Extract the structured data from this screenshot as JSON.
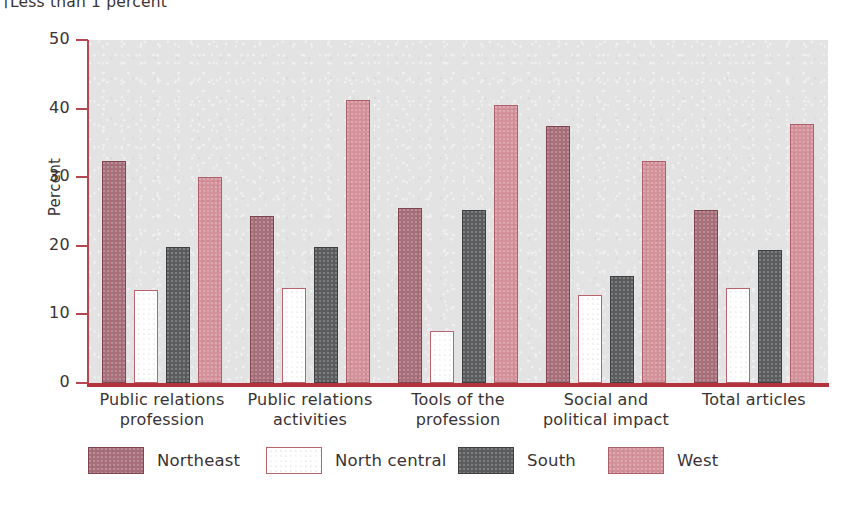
{
  "footnote": "†Less than 1 percent",
  "legend": {
    "position": "bottom",
    "items": [
      {
        "label": "Northeast",
        "key": "northeast",
        "color": "#a8707a"
      },
      {
        "label": "North central",
        "key": "northcentral",
        "color": "#ffffff"
      },
      {
        "label": "South",
        "key": "south",
        "color": "#5b5d5f"
      },
      {
        "label": "West",
        "key": "west",
        "color": "#d4929a"
      }
    ]
  },
  "axis": {
    "y_title": "Percent",
    "y_ticks": [
      "0",
      "10",
      "20",
      "30",
      "40",
      "50"
    ]
  },
  "chart_data": {
    "type": "bar",
    "title": "",
    "xlabel": "",
    "ylabel": "Percent",
    "ylim": [
      0,
      50
    ],
    "ytick_step": 10,
    "grid": false,
    "legend_position": "bottom",
    "categories": [
      "Public relations profession",
      "Public relations activities",
      "Tools of the profession",
      "Social and political impact",
      "Total articles"
    ],
    "category_lines": [
      [
        "Public relations",
        "profession"
      ],
      [
        "Public relations",
        "activities"
      ],
      [
        "Tools of the",
        "profession"
      ],
      [
        "Social and",
        "political impact"
      ],
      [
        "Total articles"
      ]
    ],
    "series": [
      {
        "name": "Northeast",
        "color": "#a8707a",
        "values": [
          32.4,
          24.3,
          25.5,
          37.5,
          25.2
        ]
      },
      {
        "name": "North central",
        "color": "#ffffff",
        "values": [
          13.6,
          13.9,
          7.6,
          12.9,
          13.8
        ]
      },
      {
        "name": "South",
        "color": "#5b5d5f",
        "values": [
          19.9,
          19.8,
          25.2,
          15.6,
          19.4
        ]
      },
      {
        "name": "West",
        "color": "#d4929a",
        "values": [
          30.0,
          41.2,
          40.5,
          32.3,
          37.7
        ]
      }
    ]
  }
}
